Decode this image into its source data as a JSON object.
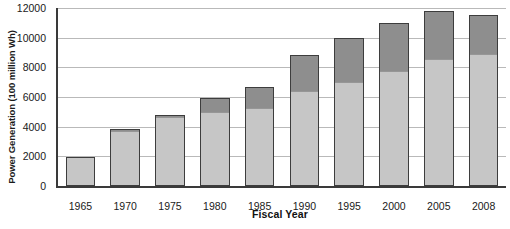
{
  "chart_data": {
    "type": "bar",
    "stacked": true,
    "title": "",
    "xlabel": "Fiscal Year",
    "ylabel": "Power Generation (100 million Wh)",
    "categories": [
      "1965",
      "1970",
      "1975",
      "1980",
      "1985",
      "1990",
      "1995",
      "2000",
      "2005",
      "2008"
    ],
    "series": [
      {
        "name": "lower-segment",
        "color": "#c6c6c6",
        "values": [
          1950,
          3800,
          4750,
          5050,
          5300,
          6500,
          7100,
          7800,
          8650,
          8950
        ]
      },
      {
        "name": "upper-segment",
        "color": "#8e8e8e",
        "values": [
          0,
          60,
          50,
          900,
          1400,
          2300,
          2900,
          3200,
          3150,
          2600
        ]
      }
    ],
    "totals": [
      1950,
      3860,
      4800,
      5950,
      6700,
      8800,
      10000,
      11000,
      11800,
      11550
    ],
    "yticks": [
      0,
      2000,
      4000,
      6000,
      8000,
      10000,
      12000
    ],
    "ylim": [
      0,
      12000
    ],
    "grid": true,
    "legend": "none"
  }
}
